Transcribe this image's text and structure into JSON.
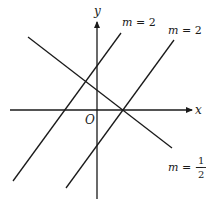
{
  "diagram": {
    "type": "coordinate-plane-lines",
    "axes": {
      "x_label": "x",
      "y_label": "y",
      "origin_label": "O",
      "x_axis": {
        "x1": 10,
        "y1": 110,
        "x2": 192,
        "y2": 110
      },
      "y_axis": {
        "x1": 97,
        "y1": 199,
        "x2": 97,
        "y2": 22
      }
    },
    "lines": [
      {
        "id": "line-slope-2-left",
        "slope_label": "m = 2",
        "x1": 13,
        "y1": 181,
        "x2": 121,
        "y2": 33
      },
      {
        "id": "line-slope-2-right",
        "slope_label": "m = 2",
        "x1": 66,
        "y1": 188,
        "x2": 174,
        "y2": 40
      },
      {
        "id": "line-slope-neg-half",
        "slope_label": "m = −1/2",
        "x1": 28,
        "y1": 37,
        "x2": 172,
        "y2": 148
      }
    ],
    "labels": {
      "m_left": {
        "m": "m",
        "eq": " = 2"
      },
      "m_right": {
        "m": "m",
        "eq": " = 2"
      },
      "m_neg": {
        "m": "m",
        "eq": " = −",
        "num": "1",
        "den": "2"
      }
    },
    "colors": {
      "line": "#1a1a1a",
      "background": "#ffffff"
    }
  }
}
